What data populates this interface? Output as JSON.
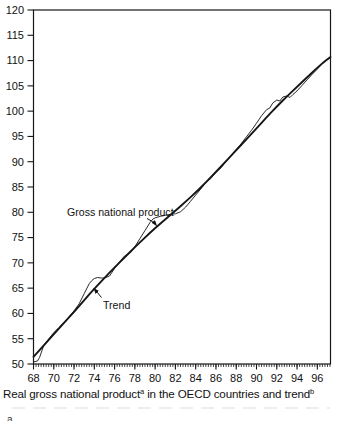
{
  "figure": {
    "caption": {
      "part1": "Real gross national product",
      "sup1": "a",
      "part2": " in the OECD countries and trend",
      "sup2": "b"
    },
    "footnote_fragment": "a"
  },
  "colors": {
    "line": "#161616",
    "gnp_line": "#2a2a2a",
    "background": "#ffffff"
  },
  "chart_data": {
    "type": "line",
    "title": "",
    "xlabel": "",
    "ylabel": "",
    "xlim": [
      68,
      97.3
    ],
    "ylim": [
      50,
      120
    ],
    "x_tick_labels": [
      "68",
      "70",
      "72",
      "74",
      "76",
      "78",
      "80",
      "82",
      "84",
      "86",
      "88",
      "90",
      "92",
      "94",
      "96"
    ],
    "x_major_ticks": [
      68,
      70,
      72,
      74,
      76,
      78,
      80,
      82,
      84,
      86,
      88,
      90,
      92,
      94,
      96
    ],
    "x_minor_step": 0.25,
    "y_tick_labels": [
      "50",
      "55",
      "60",
      "65",
      "70",
      "75",
      "80",
      "85",
      "90",
      "95",
      "100",
      "105",
      "110",
      "115",
      "120"
    ],
    "y_major_ticks": [
      50,
      55,
      60,
      65,
      70,
      75,
      80,
      85,
      90,
      95,
      100,
      105,
      110,
      115,
      120
    ],
    "grid": false,
    "legend_position": "none",
    "series": [
      {
        "name": "Gross national product",
        "role": "gnp",
        "smooth": false,
        "points": [
          [
            68,
            50.4
          ],
          [
            68.4,
            50.6
          ],
          [
            68.6,
            51.3
          ],
          [
            69,
            53.6
          ],
          [
            69.3,
            54.4
          ],
          [
            69.6,
            55.2
          ],
          [
            70,
            56.2
          ],
          [
            70.5,
            57.2
          ],
          [
            71,
            58.2
          ],
          [
            71.5,
            59.3
          ],
          [
            72,
            60.5
          ],
          [
            72.5,
            61.9
          ],
          [
            73,
            63.9
          ],
          [
            73.5,
            65.9
          ],
          [
            73.75,
            66.5
          ],
          [
            74,
            66.9
          ],
          [
            74.3,
            67.1
          ],
          [
            74.7,
            67.0
          ],
          [
            75,
            67.0
          ],
          [
            75.5,
            67.4
          ],
          [
            76,
            68.9
          ],
          [
            76.5,
            70.2
          ],
          [
            77,
            71.4
          ],
          [
            77.3,
            71.7
          ],
          [
            77.6,
            72.1
          ],
          [
            78,
            73.2
          ],
          [
            78.5,
            74.8
          ],
          [
            79,
            76.4
          ],
          [
            79.5,
            78.0
          ],
          [
            79.8,
            78.7
          ],
          [
            80,
            78.9
          ],
          [
            80.5,
            79.2
          ],
          [
            81,
            79.4
          ],
          [
            81.5,
            79.6
          ],
          [
            82,
            79.7
          ],
          [
            82.5,
            80.1
          ],
          [
            83,
            81.0
          ],
          [
            83.5,
            82.2
          ],
          [
            84,
            83.4
          ],
          [
            84.5,
            84.6
          ],
          [
            85,
            85.9
          ],
          [
            85.5,
            86.7
          ],
          [
            86,
            87.9
          ],
          [
            86.5,
            88.8
          ],
          [
            87,
            90.1
          ],
          [
            87.5,
            91.2
          ],
          [
            88,
            92.3
          ],
          [
            88.5,
            93.6
          ],
          [
            89,
            94.9
          ],
          [
            89.5,
            96.2
          ],
          [
            90,
            97.6
          ],
          [
            90.5,
            99.1
          ],
          [
            91,
            100.3
          ],
          [
            91.3,
            100.6
          ],
          [
            91.6,
            101.6
          ],
          [
            92,
            102.2
          ],
          [
            92.3,
            102.0
          ],
          [
            92.6,
            102.8
          ],
          [
            93,
            103.0
          ],
          [
            93.3,
            102.7
          ],
          [
            93.6,
            103.3
          ],
          [
            94,
            104.0
          ],
          [
            94.5,
            105.1
          ],
          [
            95,
            106.2
          ],
          [
            95.5,
            107.3
          ],
          [
            96,
            108.3
          ],
          [
            96.5,
            109.4
          ],
          [
            97,
            110.2
          ],
          [
            97.3,
            110.6
          ]
        ]
      },
      {
        "name": "Trend",
        "role": "trend",
        "smooth": true,
        "points": [
          [
            68,
            51.4
          ],
          [
            69,
            53.6
          ],
          [
            70,
            55.9
          ],
          [
            71,
            58.1
          ],
          [
            72,
            60.3
          ],
          [
            73,
            62.6
          ],
          [
            74,
            64.9
          ],
          [
            75,
            67.0
          ],
          [
            76,
            69.1
          ],
          [
            77,
            71.1
          ],
          [
            78,
            73.1
          ],
          [
            79,
            75.0
          ],
          [
            80,
            76.9
          ],
          [
            81,
            78.6
          ],
          [
            82,
            80.3
          ],
          [
            83,
            82.1
          ],
          [
            84,
            83.9
          ],
          [
            85,
            85.9
          ],
          [
            86,
            88.0
          ],
          [
            87,
            90.1
          ],
          [
            88,
            92.3
          ],
          [
            89,
            94.4
          ],
          [
            90,
            96.6
          ],
          [
            91,
            98.8
          ],
          [
            92,
            100.9
          ],
          [
            93,
            102.9
          ],
          [
            94,
            104.8
          ],
          [
            95,
            106.7
          ],
          [
            96,
            108.6
          ],
          [
            96.7,
            109.8
          ],
          [
            97.3,
            110.7
          ]
        ]
      }
    ],
    "annotations": [
      {
        "id": "gnp-label",
        "text": "Gross national product",
        "label_px": {
          "x": 67,
          "y": 215.5,
          "anchor": "start"
        },
        "leader_px": {
          "x1": 147,
          "y1": 218.5,
          "cx": 153,
          "cy": 221,
          "x2": 156.5,
          "y2": 225.5
        }
      },
      {
        "id": "trend-label",
        "text": "Trend",
        "label_px": {
          "x": 103,
          "y": 309,
          "anchor": "start"
        },
        "leader_px": {
          "x1": 101.5,
          "y1": 297.5,
          "x2": 94,
          "y2": 288.5
        }
      }
    ]
  }
}
